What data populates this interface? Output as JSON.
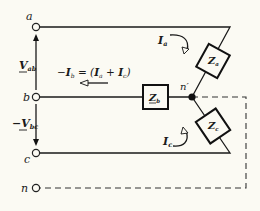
{
  "diagram": {
    "terminals": {
      "a": "a",
      "b": "b",
      "c": "c",
      "n": "n"
    },
    "node_label": "n′",
    "impedances": {
      "za": {
        "main": "Z",
        "sub": "a"
      },
      "zb": {
        "main": "Z",
        "sub": "b"
      },
      "zc": {
        "main": "Z",
        "sub": "c"
      }
    },
    "voltages": {
      "vab": {
        "prefix": "",
        "main": "V",
        "sub": "ab"
      },
      "vbc": {
        "prefix": "−",
        "main": "V",
        "sub": "bc"
      }
    },
    "currents": {
      "ia": {
        "main": "I",
        "sub": "a"
      },
      "ic": {
        "main": "I",
        "sub": "c"
      },
      "ib_equation": {
        "lhs_prefix": "−",
        "lhs_main": "I",
        "lhs_sub": "b",
        "equals": " = (",
        "t1_main": "I",
        "t1_sub": "a",
        "plus": " + ",
        "t2_main": "I",
        "t2_sub": "c",
        "close": ")"
      }
    },
    "colors": {
      "background": "#fbfaf3",
      "ink": "#1a1a1a"
    }
  }
}
